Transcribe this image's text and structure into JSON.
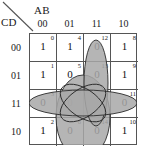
{
  "diagram": {
    "type": "karnaugh-map",
    "variables_top_label": "AB",
    "variables_side_label": "CD",
    "column_headers": [
      "00",
      "01",
      "11",
      "10"
    ],
    "row_headers": [
      "00",
      "01",
      "11",
      "10"
    ],
    "cells": [
      [
        {
          "index": "0",
          "value": "1",
          "shaded": false
        },
        {
          "index": "4",
          "value": "1",
          "shaded": false
        },
        {
          "index": "12",
          "value": "0",
          "shaded": true
        },
        {
          "index": "8",
          "value": "1",
          "shaded": false
        }
      ],
      [
        {
          "index": "1",
          "value": "1",
          "shaded": false
        },
        {
          "index": "5",
          "value": "0",
          "shaded": true
        },
        {
          "index": "13",
          "value": "0",
          "shaded": true
        },
        {
          "index": "9",
          "value": "1",
          "shaded": false
        }
      ],
      [
        {
          "index": "3",
          "value": "0",
          "shaded": true
        },
        {
          "index": "7",
          "value": "0",
          "shaded": true
        },
        {
          "index": "15",
          "value": "0",
          "shaded": true
        },
        {
          "index": "11",
          "value": "0",
          "shaded": true
        }
      ],
      [
        {
          "index": "2",
          "value": "1",
          "shaded": false
        },
        {
          "index": "6",
          "value": "0",
          "shaded": true
        },
        {
          "index": "14",
          "value": "0",
          "shaded": true
        },
        {
          "index": "10",
          "value": "1",
          "shaded": false
        }
      ]
    ],
    "groups": [
      {
        "name": "row-11-horizontal-ellipse",
        "covers": [
          "3",
          "7",
          "15",
          "11"
        ]
      },
      {
        "name": "columns-01-11-vertical-ellipse",
        "covers": [
          "5",
          "13",
          "7",
          "15",
          "6",
          "14"
        ]
      },
      {
        "name": "column-11-narrow-vertical-ellipse",
        "covers": [
          "12",
          "13",
          "15",
          "14"
        ]
      },
      {
        "name": "center-crossing-ellipse-a",
        "covers": [
          "7",
          "15",
          "5",
          "13"
        ]
      },
      {
        "name": "center-crossing-ellipse-b",
        "covers": [
          "7",
          "15",
          "6",
          "14"
        ]
      }
    ],
    "colors": {
      "shading": "#a8a8a8",
      "grid_line": "#555555",
      "group_outline": "#2b2b2b",
      "text": "#1a1a1a",
      "background": "#ffffff"
    }
  }
}
